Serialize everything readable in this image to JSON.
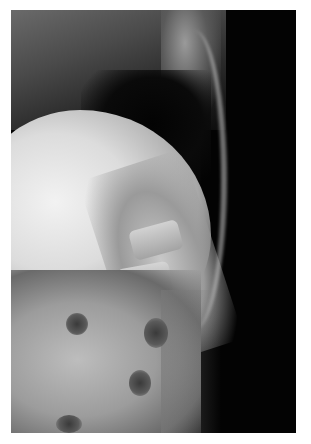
{
  "image": {
    "description": "Lateral radiograph of the thoracolumbar spine",
    "colors": {
      "background": "#ffffff",
      "film_dark": "#050505",
      "bone_bright": "#f2f2f2"
    }
  }
}
